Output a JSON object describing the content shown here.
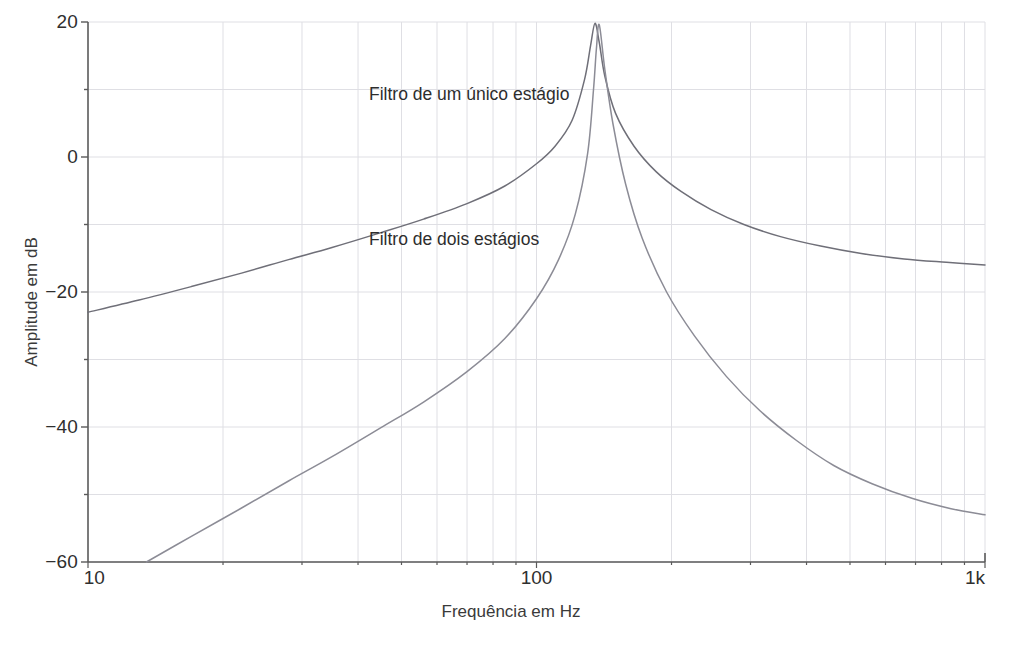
{
  "figure": {
    "axis_color": "#5a5a5a",
    "grid_color": "#dfdfe4",
    "curve_color": "#6f6f78"
  },
  "labels": {
    "ylabel": "Amplitude em dB",
    "xlabel": "Frequência em Hz",
    "annotation_single": "Filtro de um único estágio",
    "annotation_double": "Filtro de dois estágios"
  },
  "yticks": [
    {
      "value": 20,
      "text": "20"
    },
    {
      "value": 0,
      "text": "0"
    },
    {
      "value": -20,
      "text": "−20"
    },
    {
      "value": -40,
      "text": "−40"
    },
    {
      "value": -60,
      "text": "−60"
    }
  ],
  "xticks": [
    {
      "value": 10,
      "text": "10"
    },
    {
      "value": 100,
      "text": "100"
    },
    {
      "value": 1000,
      "text": "1k"
    }
  ],
  "chart_data": {
    "type": "line",
    "title": "",
    "xlabel": "Frequência em Hz",
    "ylabel": "Amplitude em dB",
    "xscale": "log",
    "yscale": "linear",
    "xlim": [
      10,
      1000
    ],
    "ylim": [
      -60,
      20
    ],
    "grid": true,
    "grid_major_y": [
      20,
      10,
      0,
      -10,
      -20,
      -30,
      -40,
      -50,
      -60
    ],
    "grid_minor_x_decades": [
      20,
      30,
      40,
      50,
      60,
      70,
      80,
      90,
      200,
      300,
      400,
      500,
      600,
      700,
      800,
      900
    ],
    "legend": "annotations-in-plot",
    "resonance_hz": 135,
    "peak_db": 20,
    "series": [
      {
        "name": "Filtro de um único estágio",
        "color": "#6f6f78",
        "x": [
          10,
          13,
          17,
          22,
          28,
          35,
          45,
          56,
          70,
          85,
          100,
          110,
          120,
          128,
          132,
          135,
          138,
          142,
          150,
          165,
          185,
          210,
          245,
          290,
          350,
          430,
          530,
          660,
          820,
          1000
        ],
        "y": [
          -23.0,
          -21.2,
          -19.2,
          -17.2,
          -15.2,
          -13.4,
          -11.2,
          -9.2,
          -6.9,
          -4.3,
          -1.0,
          1.6,
          5.4,
          11.5,
          16.5,
          19.8,
          17.0,
          12.0,
          6.5,
          1.6,
          -2.2,
          -5.1,
          -7.8,
          -10.0,
          -11.8,
          -13.2,
          -14.3,
          -15.1,
          -15.6,
          -16.0
        ]
      },
      {
        "name": "Filtro de dois estágios",
        "color": "#8c8c96",
        "x": [
          13.5,
          17,
          22,
          28,
          35,
          45,
          56,
          70,
          85,
          100,
          112,
          122,
          130,
          134,
          136,
          138,
          142,
          148,
          158,
          172,
          195,
          225,
          265,
          315,
          380,
          460,
          560,
          690,
          840,
          1000
        ],
        "y": [
          -60.0,
          -56.2,
          -52.0,
          -48.0,
          -44.4,
          -40.1,
          -36.3,
          -31.8,
          -26.9,
          -21.0,
          -15.2,
          -8.5,
          0.5,
          10.0,
          16.0,
          19.6,
          13.0,
          5.0,
          -4.0,
          -12.0,
          -20.0,
          -26.5,
          -32.5,
          -37.6,
          -42.0,
          -45.7,
          -48.4,
          -50.6,
          -52.1,
          -53.0
        ]
      }
    ]
  },
  "geometry": {
    "plot_left": 88,
    "plot_right": 985,
    "plot_top": 22,
    "plot_bottom": 562
  }
}
